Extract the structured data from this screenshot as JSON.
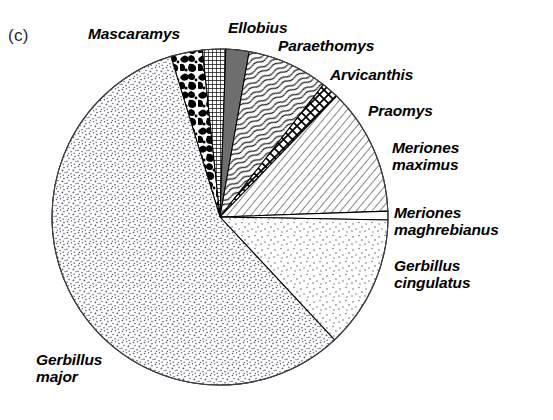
{
  "figure": {
    "panel_letter": "(c)",
    "background_color": "#ffffff",
    "line_color": "#000000"
  },
  "labels": {
    "mascaramys": "Mascaramys",
    "ellobius": "Ellobius",
    "paraethomys": "Paraethomys",
    "arvicanthis": "Arvicanthis",
    "praomys": "Praomys",
    "meriones_maximus": "Meriones\nmaximus",
    "meriones_maghrebianus": "Meriones\nmaghrebianus",
    "gerbillus_cingulatus": "Gerbillus\ncingulatus",
    "gerbillus_major": "Gerbillus\nmajor"
  },
  "chart_data": {
    "type": "pie",
    "title": "(c)",
    "subtitle": "",
    "xlabel": "",
    "ylabel": "",
    "grid": false,
    "legend_position": "labels-around-pie",
    "units": "percent of assemblage",
    "center": {
      "x": 220,
      "y": 217
    },
    "radius": 168,
    "start_angle_deg": 107,
    "direction": "clockwise",
    "categories": [
      "Mascaramys",
      "Ellobius",
      "Paraethomys",
      "Arvicanthis",
      "Praomys",
      "Meriones maximus",
      "Meriones maghrebianus",
      "Gerbillus cingulatus",
      "Gerbillus major"
    ],
    "values": [
      3.1,
      2.2,
      2.2,
      7.8,
      1.7,
      12.2,
      0.8,
      12.8,
      57.2
    ],
    "slices": [
      {
        "label": "Mascaramys",
        "value": 3.1,
        "start_angle_deg": 107,
        "end_angle_deg": 96,
        "fill": "mottled-black-blobs",
        "fill_color": "#000000"
      },
      {
        "label": "Ellobius",
        "value": 2.2,
        "start_angle_deg": 96,
        "end_angle_deg": 88,
        "fill": "fine-grid-mesh",
        "fill_color": "#555555"
      },
      {
        "label": "Paraethomys",
        "value": 2.2,
        "start_angle_deg": 88,
        "end_angle_deg": 80,
        "fill": "solid-grey",
        "fill_color": "#6e6e6e"
      },
      {
        "label": "Arvicanthis",
        "value": 7.8,
        "start_angle_deg": 80,
        "end_angle_deg": 52,
        "fill": "wavy-short-strokes",
        "fill_color": "#333333"
      },
      {
        "label": "Praomys",
        "value": 1.7,
        "start_angle_deg": 52,
        "end_angle_deg": 46,
        "fill": "zigzag-crosshatch",
        "fill_color": "#000000"
      },
      {
        "label": "Meriones maximus",
        "value": 12.2,
        "start_angle_deg": 46,
        "end_angle_deg": 2,
        "fill": "diagonal-hatch",
        "fill_color": "#444444"
      },
      {
        "label": "Meriones maghrebianus",
        "value": 0.8,
        "start_angle_deg": 2,
        "end_angle_deg": -1,
        "fill": "white-thin-sliver",
        "fill_color": "#ffffff"
      },
      {
        "label": "Gerbillus cingulatus",
        "value": 12.8,
        "start_angle_deg": -1,
        "end_angle_deg": -47,
        "fill": "sparse-stipple",
        "fill_color": "#8a8a8a"
      },
      {
        "label": "Gerbillus major",
        "value": 57.2,
        "start_angle_deg": -47,
        "end_angle_deg": -253,
        "fill": "dense-stipple",
        "fill_color": "#9a9a9a"
      }
    ]
  }
}
